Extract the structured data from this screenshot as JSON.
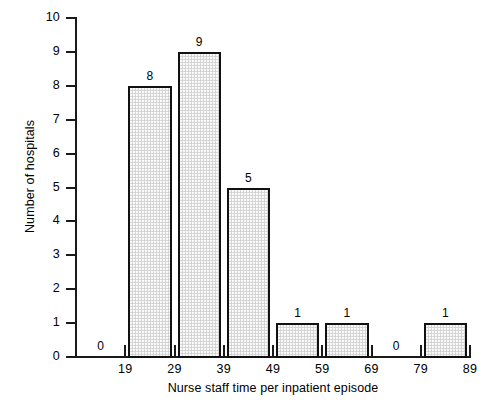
{
  "chart_data": {
    "type": "bar",
    "title": "",
    "xlabel": "Nurse staff time per inpatient episode",
    "ylabel": "Number of hospitals",
    "categories": [
      "9-19",
      "19-29",
      "29-39",
      "39-49",
      "49-59",
      "59-69",
      "69-79",
      "79-89"
    ],
    "bin_edges": [
      9,
      19,
      29,
      39,
      49,
      59,
      69,
      79,
      89
    ],
    "values": [
      0,
      8,
      9,
      5,
      1,
      1,
      0,
      1
    ],
    "bar_labels": [
      "0",
      "8",
      "9",
      "5",
      "1",
      "1",
      "0",
      "1"
    ],
    "xlim": [
      9,
      89
    ],
    "ylim": [
      0,
      10
    ],
    "x_tick_values": [
      19,
      29,
      39,
      49,
      59,
      69,
      79,
      89
    ],
    "x_tick_labels": [
      "19",
      "29",
      "39",
      "49",
      "59",
      "69",
      "79",
      "89"
    ],
    "y_tick_values": [
      0,
      1,
      2,
      3,
      4,
      5,
      6,
      7,
      8,
      9,
      10
    ],
    "y_tick_labels": [
      "0",
      "1",
      "2",
      "3",
      "4",
      "5",
      "6",
      "7",
      "8",
      "9",
      "10"
    ],
    "grid": false,
    "legend": false,
    "bar_fill_color": "#dcdcdc",
    "bar_edge_color": "#111111",
    "axis_color": "#1a1a1a",
    "background_color": "#ffffff"
  }
}
